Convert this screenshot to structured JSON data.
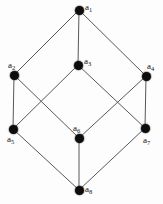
{
  "figure": {
    "kind": "hasse-diagram",
    "background_color": "#fdfdfd",
    "node_color": "#0d0d0d",
    "edge_color": "#58585a",
    "label_color": "#111111",
    "width": 163,
    "height": 204
  },
  "chart_data": {
    "type": "diagram",
    "title": "",
    "nodes": [
      {
        "id": "a1",
        "label": "a",
        "sub": "1",
        "x": 79,
        "y": 10,
        "label_x": 85,
        "label_y": 3,
        "rank": 0
      },
      {
        "id": "a2",
        "label": "a",
        "sub": "2",
        "x": 14,
        "y": 75,
        "label_x": 8,
        "label_y": 61,
        "rank": 1
      },
      {
        "id": "a3",
        "label": "a",
        "sub": "3",
        "x": 78,
        "y": 65,
        "label_x": 84,
        "label_y": 57,
        "rank": 1
      },
      {
        "id": "a4",
        "label": "a",
        "sub": "4",
        "x": 146,
        "y": 76,
        "label_x": 147,
        "label_y": 62,
        "rank": 1
      },
      {
        "id": "a5",
        "label": "a",
        "sub": "5",
        "x": 13,
        "y": 129,
        "label_x": 7,
        "label_y": 135,
        "rank": 2
      },
      {
        "id": "a6",
        "label": "a",
        "sub": "6",
        "x": 79,
        "y": 138,
        "label_x": 73,
        "label_y": 124,
        "rank": 2
      },
      {
        "id": "a7",
        "label": "a",
        "sub": "7",
        "x": 145,
        "y": 128,
        "label_x": 143,
        "label_y": 136,
        "rank": 2
      },
      {
        "id": "a8",
        "label": "a",
        "sub": "8",
        "x": 79,
        "y": 190,
        "label_x": 85,
        "label_y": 185,
        "rank": 3
      }
    ],
    "edges": [
      {
        "from": "a1",
        "to": "a2"
      },
      {
        "from": "a1",
        "to": "a3"
      },
      {
        "from": "a1",
        "to": "a4"
      },
      {
        "from": "a2",
        "to": "a5"
      },
      {
        "from": "a2",
        "to": "a6"
      },
      {
        "from": "a3",
        "to": "a5"
      },
      {
        "from": "a3",
        "to": "a7"
      },
      {
        "from": "a4",
        "to": "a6"
      },
      {
        "from": "a4",
        "to": "a7"
      },
      {
        "from": "a5",
        "to": "a8"
      },
      {
        "from": "a6",
        "to": "a8"
      },
      {
        "from": "a7",
        "to": "a8"
      }
    ]
  }
}
